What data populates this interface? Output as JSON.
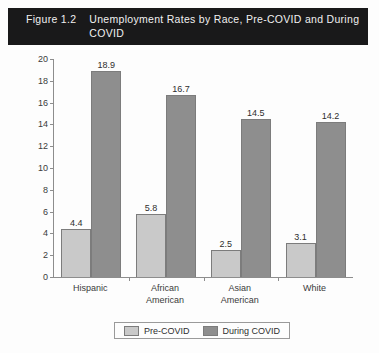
{
  "figure": {
    "number": "Figure 1.2",
    "title": "Unemployment Rates by Race, Pre-COVID and During COVID"
  },
  "colors": {
    "title_band_bg": "#19191a",
    "title_band_text": "#f0f0f0",
    "pre_covid_bar": "#c9c9c9",
    "during_covid_bar": "#8e8e8e",
    "axis_line": "#8d8d8d",
    "plot_bg": "#fdfdfd"
  },
  "chart_data": {
    "type": "bar",
    "title": "Unemployment Rates by Race, Pre-COVID and During COVID",
    "xlabel": "",
    "ylabel": "",
    "ylim": [
      0,
      20
    ],
    "yticks": [
      0,
      2,
      4,
      6,
      8,
      10,
      12,
      14,
      16,
      18,
      20
    ],
    "ytick_labels": [
      "0",
      "2",
      "4",
      "6",
      "8",
      "10",
      "12",
      "14",
      "16",
      "18",
      "20"
    ],
    "grid": false,
    "legend_position": "bottom",
    "categories": [
      "Hispanic",
      "African American",
      "Asian American",
      "White"
    ],
    "category_label_lines": [
      [
        "Hispanic"
      ],
      [
        "African",
        "American"
      ],
      [
        "Asian",
        "American"
      ],
      [
        "White"
      ]
    ],
    "series": [
      {
        "name": "Pre-COVID",
        "color": "#c9c9c9",
        "values": [
          4.4,
          5.8,
          2.5,
          3.1
        ],
        "value_labels": [
          "4.4",
          "5.8",
          "2.5",
          "3.1"
        ]
      },
      {
        "name": "During COVID",
        "color": "#8e8e8e",
        "values": [
          18.9,
          16.7,
          14.5,
          14.2
        ],
        "value_labels": [
          "18.9",
          "16.7",
          "14.5",
          "14.2"
        ]
      }
    ]
  },
  "legend": {
    "entries": [
      {
        "label": "Pre-COVID"
      },
      {
        "label": "During COVID"
      }
    ]
  }
}
